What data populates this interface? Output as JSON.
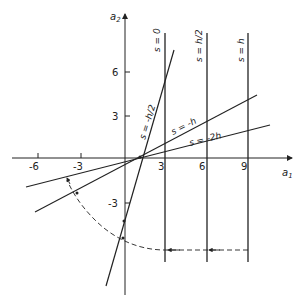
{
  "axes": {
    "x_label": "a",
    "x_label_sub": "1",
    "y_label": "a",
    "y_label_sub": "2",
    "x_ticks": [
      {
        "value": -6,
        "label": "-6"
      },
      {
        "value": -3,
        "label": "-3"
      },
      {
        "value": 3,
        "label": "3"
      },
      {
        "value": 6,
        "label": "6"
      },
      {
        "value": 9,
        "label": "9"
      }
    ],
    "y_ticks": [
      {
        "value": 6,
        "label": "6"
      },
      {
        "value": 3,
        "label": "3"
      },
      {
        "value": -3,
        "label": "-3"
      }
    ]
  },
  "lines": {
    "vertical": [
      {
        "label": "s = 0",
        "a1": 3
      },
      {
        "label": "s = h/2",
        "a1": 6
      },
      {
        "label": "s = h",
        "a1": 9
      }
    ],
    "steep": {
      "label": "s = -h/2"
    },
    "shallow_1": {
      "label": "s = -h"
    },
    "shallow_2": {
      "label": "s = -2h"
    }
  },
  "colors": {
    "ink": "#222222",
    "background": "#ffffff"
  }
}
